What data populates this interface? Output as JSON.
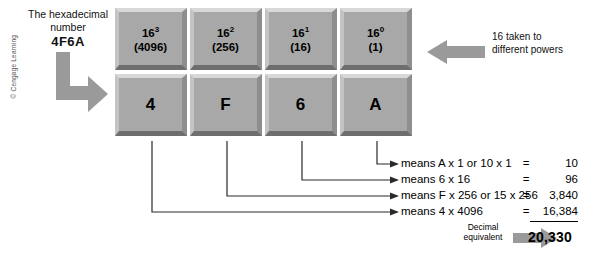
{
  "caption": {
    "line1": "The hexadecimal",
    "line2": "number",
    "value": "4F6A"
  },
  "copyright": "© Cengage Learning",
  "right_note": "16 taken to different powers",
  "grid": {
    "powers": [
      {
        "power_label": "16",
        "exponent": "3",
        "value_label": "(4096)"
      },
      {
        "power_label": "16",
        "exponent": "2",
        "value_label": "(256)"
      },
      {
        "power_label": "16",
        "exponent": "1",
        "value_label": "(16)"
      },
      {
        "power_label": "16",
        "exponent": "0",
        "value_label": "(1)"
      }
    ],
    "digits": [
      "4",
      "F",
      "6",
      "A"
    ]
  },
  "equations": [
    {
      "means": "means A x 1 or 10 x 1",
      "sign": "=",
      "value": "10"
    },
    {
      "means": "means 6 x 16",
      "sign": "=",
      "value": "96"
    },
    {
      "means": "means F x 256 or 15 x 256",
      "sign": "=",
      "value": "3,840"
    },
    {
      "means": "means 4 x 4096",
      "sign": "=",
      "value": "16,384"
    }
  ],
  "decimal_label_line1": "Decimal",
  "decimal_label_line2": "equivalent",
  "total": "20,330",
  "colors": {
    "box_face": "#a8a8a8",
    "box_highlight": "#d8d8d8",
    "box_shadow": "#6e6e6e",
    "arrow_gray": "#9a9a9a",
    "text": "#000000"
  }
}
